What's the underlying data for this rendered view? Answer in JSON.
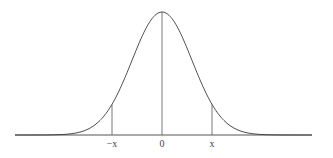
{
  "figure": {
    "colors": {
      "curve": "#3a3a3a",
      "lines": "#555555",
      "text": "#444444",
      "background": "#ffffff"
    },
    "labels": {
      "neg_x": "−x",
      "zero": "0",
      "pos_x": "x"
    },
    "geometry": {
      "center_px": 162,
      "peak_y_px": 12,
      "baseline_y_px": 135,
      "sigma_px": 30,
      "baseline_x_start_px": 15,
      "baseline_x_end_px": 312,
      "marker_offset_px": 50,
      "label_y_px": 147
    }
  }
}
